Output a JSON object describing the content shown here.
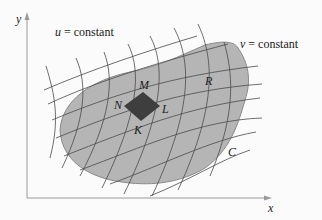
{
  "figure": {
    "axes": {
      "x_label": "x",
      "y_label": "y"
    },
    "annotations": {
      "u_var": "u",
      "u_rest": " = constant",
      "v_var": "v",
      "v_rest": " = constant"
    },
    "region_label": "R",
    "boundary_label": "C",
    "element_vertices": {
      "top": "M",
      "left": "N",
      "right": "L",
      "bottom": "K"
    },
    "colors": {
      "region_fill": "#b5b5b5",
      "region_stroke": "#8a8a8a",
      "element_fill": "#3e3e3e",
      "grid_line": "#4a4a4a",
      "axis": "#9a9a9a",
      "background": "#fbfbfb"
    }
  }
}
